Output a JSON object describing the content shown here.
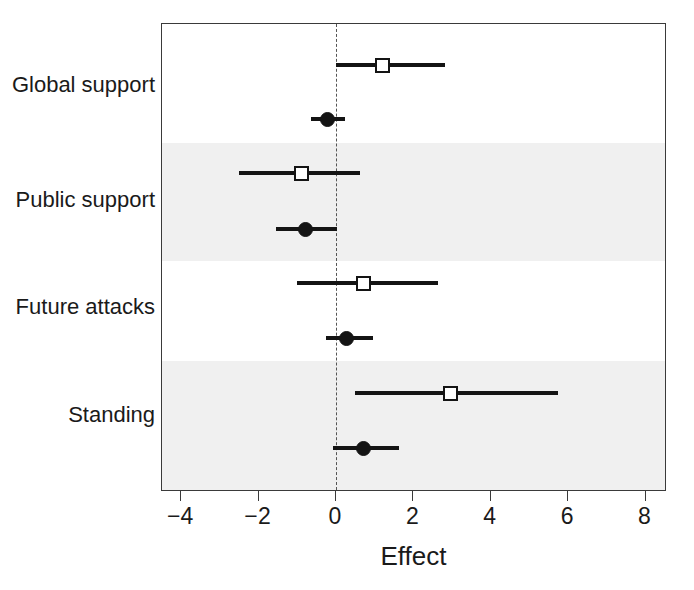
{
  "chart_data": {
    "type": "scatter",
    "subtype": "forest-plot",
    "title": "",
    "xlabel": "Effect",
    "ylabel": "",
    "xlim": [
      -4.8,
      8.8
    ],
    "xticks": [
      -4,
      -2,
      0,
      2,
      4,
      6,
      8
    ],
    "xticklabels": [
      "−4",
      "−2",
      "0",
      "2",
      "4",
      "6",
      "8"
    ],
    "grid": false,
    "legend": null,
    "reference_line": {
      "x": 0,
      "style": "dashed",
      "color": "#555555"
    },
    "categories": [
      "Global support",
      "Public support",
      "Future attacks",
      "Standing"
    ],
    "band_shading": {
      "color": "#f0f0f0",
      "shaded_categories": [
        "Public support",
        "Standing"
      ]
    },
    "marker_types": [
      {
        "name": "open-square",
        "fill": "#ffffff",
        "edge": "#141414"
      },
      {
        "name": "filled-circle",
        "fill": "#141414",
        "edge": "#141414"
      }
    ],
    "points": [
      {
        "category": "Global support",
        "marker": "open-square",
        "estimate": 1.21,
        "ci_low": 0.0,
        "ci_high": 2.82
      },
      {
        "category": "Global support",
        "marker": "filled-circle",
        "estimate": -0.23,
        "ci_low": -0.65,
        "ci_high": 0.23
      },
      {
        "category": "Public support",
        "marker": "open-square",
        "estimate": -0.9,
        "ci_low": -2.51,
        "ci_high": 0.62
      },
      {
        "category": "Public support",
        "marker": "filled-circle",
        "estimate": -0.78,
        "ci_low": -1.55,
        "ci_high": 0.03
      },
      {
        "category": "Future attacks",
        "marker": "open-square",
        "estimate": 0.72,
        "ci_low": -1.01,
        "ci_high": 2.64
      },
      {
        "category": "Future attacks",
        "marker": "filled-circle",
        "estimate": 0.26,
        "ci_low": -0.26,
        "ci_high": 0.96
      },
      {
        "category": "Standing",
        "marker": "open-square",
        "estimate": 2.95,
        "ci_low": 0.49,
        "ci_high": 5.74
      },
      {
        "category": "Standing",
        "marker": "filled-circle",
        "estimate": 0.72,
        "ci_low": -0.08,
        "ci_high": 1.63
      }
    ]
  }
}
